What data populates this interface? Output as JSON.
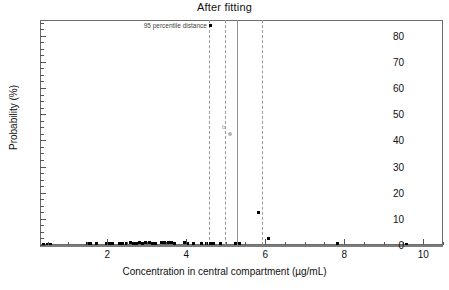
{
  "chart_data": {
    "type": "scatter",
    "title": "After fitting",
    "xlabel": "Concentration in central compartment (µg/mL)",
    "ylabel": "Probability (%)",
    "xlim": [
      0.3,
      10.5
    ],
    "ylim": [
      0,
      86
    ],
    "xticks": [
      2,
      4,
      6,
      8,
      10
    ],
    "xtick_labels": [
      "2",
      "4",
      "6",
      "8",
      "10"
    ],
    "x_minor_step": 0.5,
    "yticks": [
      0,
      10,
      20,
      30,
      40,
      50,
      60,
      70,
      80
    ],
    "ytick_labels": [
      "0",
      "10",
      "20",
      "30",
      "40",
      "50",
      "60",
      "70",
      "80"
    ],
    "y_minor_step": 2.5,
    "grid": false,
    "legend": "none",
    "marker_color": "#000000",
    "gray_marker_color": "#b4b4b4",
    "vline_color": "#9a9a9a",
    "frame_color": "#6b6b6b",
    "annotations": [
      {
        "text": "95 percentile distance",
        "x": 4.55,
        "y": 84.0,
        "color": "#444444"
      },
      {
        "text": "b",
        "x": 4.95,
        "y": 45.0,
        "color": "#9a9a9a"
      }
    ],
    "vlines": [
      {
        "x": 4.58,
        "style": "dashed"
      },
      {
        "x": 4.98,
        "style": "dashed"
      },
      {
        "x": 5.28,
        "style": "solid"
      },
      {
        "x": 5.93,
        "style": "dashed"
      }
    ],
    "points": [
      {
        "x": 4.62,
        "y": 84.0
      },
      {
        "x": 5.12,
        "y": 42.5,
        "color": "gray"
      },
      {
        "x": 5.82,
        "y": 12.5
      },
      {
        "x": 6.08,
        "y": 2.6
      },
      {
        "x": 0.4,
        "y": 0.3
      },
      {
        "x": 0.48,
        "y": 0.3
      },
      {
        "x": 0.56,
        "y": 0.3
      },
      {
        "x": 1.5,
        "y": 0.5
      },
      {
        "x": 1.58,
        "y": 0.5
      },
      {
        "x": 1.72,
        "y": 0.4
      },
      {
        "x": 1.98,
        "y": 0.6
      },
      {
        "x": 2.06,
        "y": 0.6
      },
      {
        "x": 2.14,
        "y": 0.5
      },
      {
        "x": 2.3,
        "y": 0.6
      },
      {
        "x": 2.4,
        "y": 0.7
      },
      {
        "x": 2.5,
        "y": 0.6
      },
      {
        "x": 2.58,
        "y": 0.8
      },
      {
        "x": 2.66,
        "y": 0.7
      },
      {
        "x": 2.74,
        "y": 0.6
      },
      {
        "x": 2.82,
        "y": 0.8
      },
      {
        "x": 2.9,
        "y": 0.7
      },
      {
        "x": 2.98,
        "y": 0.9
      },
      {
        "x": 3.06,
        "y": 0.8
      },
      {
        "x": 3.14,
        "y": 0.7
      },
      {
        "x": 3.22,
        "y": 0.6
      },
      {
        "x": 3.38,
        "y": 0.9
      },
      {
        "x": 3.46,
        "y": 0.8
      },
      {
        "x": 3.54,
        "y": 1.0
      },
      {
        "x": 3.62,
        "y": 0.8
      },
      {
        "x": 3.7,
        "y": 0.7
      },
      {
        "x": 3.96,
        "y": 0.8
      },
      {
        "x": 4.04,
        "y": 0.7
      },
      {
        "x": 4.18,
        "y": 0.6
      },
      {
        "x": 4.4,
        "y": 0.5
      },
      {
        "x": 4.52,
        "y": 0.6
      },
      {
        "x": 4.62,
        "y": 0.7
      },
      {
        "x": 4.7,
        "y": 0.6
      },
      {
        "x": 4.86,
        "y": 0.5
      },
      {
        "x": 5.26,
        "y": 0.6
      },
      {
        "x": 5.34,
        "y": 0.5
      },
      {
        "x": 7.82,
        "y": 0.4
      },
      {
        "x": 9.58,
        "y": 0.3
      }
    ]
  }
}
